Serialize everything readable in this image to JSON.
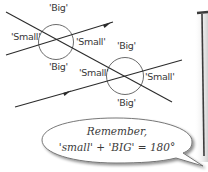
{
  "diagram": {
    "type": "parallel-lines-transversal",
    "colors": {
      "line": "#2b2b2b",
      "circle": "#555555",
      "text": "#3a3a3a",
      "frame": "#3c3c3c",
      "bubble_fill": "#ffffff",
      "bubble_stroke": "#6a6a6a"
    },
    "intersection_1": {
      "top_label": "'Big'",
      "left_label": "'Small'",
      "right_label": "'Small'",
      "bottom_label": "'Big'"
    },
    "intersection_2": {
      "top_label": "'Big'",
      "left_label": "'Small'",
      "right_label": "'Small'",
      "bottom_label": "'Big'"
    },
    "callout": {
      "line1": "Remember,",
      "line2": "'small' + 'BIG' = 180°"
    }
  }
}
